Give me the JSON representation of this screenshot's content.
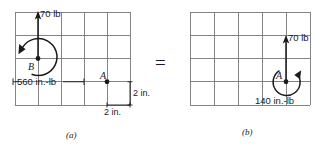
{
  "figure": {
    "equals_symbol": "=",
    "panels": [
      {
        "id": "a",
        "caption": "(a)",
        "grid": {
          "cols": 5,
          "rows": 4,
          "cell_size_label": "2 in."
        },
        "point_labels": [
          {
            "name": "B",
            "text": "B"
          },
          {
            "name": "A",
            "text": "A"
          }
        ],
        "force": {
          "magnitude": "70 lb",
          "direction": "up"
        },
        "moment": {
          "magnitude": "560 in.-lb",
          "sense": "counterclockwise"
        },
        "dimensions": [
          {
            "name": "vertical",
            "text": "2 in."
          },
          {
            "name": "horizontal",
            "text": "2 in."
          }
        ]
      },
      {
        "id": "b",
        "caption": "(b)",
        "grid": {
          "cols": 5,
          "rows": 4,
          "cell_size_label": "2 in."
        },
        "point_labels": [
          {
            "name": "A",
            "text": "A"
          }
        ],
        "force": {
          "magnitude": "70 lb",
          "direction": "up"
        },
        "moment": {
          "magnitude": "140 in.-lb",
          "sense": "clockwise"
        },
        "dimensions": []
      }
    ]
  },
  "colors": {
    "grid_line": "#6b6b6b",
    "grid_line_light": "#9a9a9a",
    "ink": "#1a1a1a",
    "background": "#ffffff"
  }
}
